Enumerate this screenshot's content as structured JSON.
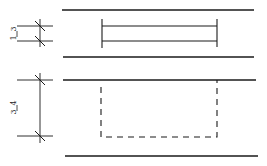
{
  "diagram": {
    "dimension_top": {
      "numerator": "1",
      "denominator": "3"
    },
    "dimension_bottom": {
      "numerator": "3",
      "denominator": "4"
    },
    "colors": {
      "line": "#1a1a1a",
      "background": "#ffffff"
    }
  }
}
